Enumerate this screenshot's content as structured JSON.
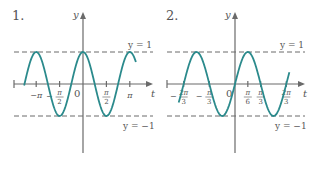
{
  "chart_data": [
    {
      "type": "line",
      "panel_label": "1.",
      "function": "y = cos(2t)",
      "xlabel": "t",
      "ylabel": "y",
      "x_domain": [
        -4.1,
        3.7
      ],
      "ylim": [
        -1,
        1
      ],
      "curve_domain": [
        -3.95,
        3.55
      ],
      "x_ticks": [
        {
          "value": -3.14159,
          "num": "−π",
          "den": ""
        },
        {
          "value": -1.5708,
          "num": "π",
          "den": "2",
          "neg": true
        },
        {
          "value": 1.5708,
          "num": "π",
          "den": "2"
        },
        {
          "value": 3.14159,
          "num": "π",
          "den": ""
        }
      ],
      "origin_label": "0",
      "reference_lines": [
        {
          "y": 1,
          "label": "y = 1"
        },
        {
          "y": -1,
          "label": "y = −1"
        }
      ],
      "omega": 2,
      "kind": "cos"
    },
    {
      "type": "line",
      "panel_label": "2.",
      "function": "y = sin(3t)",
      "xlabel": "t",
      "ylabel": "y",
      "x_domain": [
        -2.8,
        2.8
      ],
      "ylim": [
        -1,
        1
      ],
      "curve_domain": [
        -2.3,
        2.22
      ],
      "x_ticks": [
        {
          "value": -2.0944,
          "num": "2π",
          "den": "3",
          "neg": true
        },
        {
          "value": -1.0472,
          "num": "π",
          "den": "3",
          "neg": true
        },
        {
          "value": 0.5236,
          "num": "π",
          "den": "6"
        },
        {
          "value": 1.0472,
          "num": "π",
          "den": "3"
        },
        {
          "value": 2.0944,
          "num": "2π",
          "den": "3"
        }
      ],
      "origin_label": "0",
      "reference_lines": [
        {
          "y": 1,
          "label": "y = 1"
        },
        {
          "y": -1,
          "label": "y = −1"
        }
      ],
      "omega": 3,
      "kind": "sin"
    }
  ]
}
